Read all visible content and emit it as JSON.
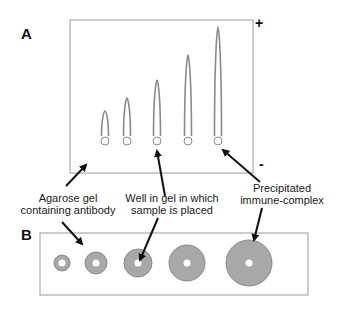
{
  "panels": {
    "a": {
      "label": "A",
      "plus": "+",
      "minus": "-"
    },
    "b": {
      "label": "B"
    }
  },
  "annotations": {
    "agarose": {
      "line1": "Agarose gel",
      "line2": "containing antibody"
    },
    "well": {
      "line1": "Well in gel in which",
      "line2": "sample is placed"
    },
    "complex": {
      "line1": "Precipitated",
      "line2": "immune-complex"
    }
  },
  "colors": {
    "precipitate_fill": "#a8a8a8",
    "precipitate_stroke": "#8a8a8a",
    "box_stroke": "#9a9a9a",
    "arrow": "#111111"
  },
  "panel_a_rockets": [
    {
      "x": 105,
      "top": 111
    },
    {
      "x": 127,
      "top": 98
    },
    {
      "x": 157,
      "top": 80
    },
    {
      "x": 188,
      "top": 55
    },
    {
      "x": 218,
      "top": 27
    }
  ],
  "panel_b_rings": [
    {
      "x": 62,
      "r": 8
    },
    {
      "x": 96,
      "r": 11
    },
    {
      "x": 138,
      "r": 14
    },
    {
      "x": 187,
      "r": 18
    },
    {
      "x": 249,
      "r": 23
    }
  ]
}
